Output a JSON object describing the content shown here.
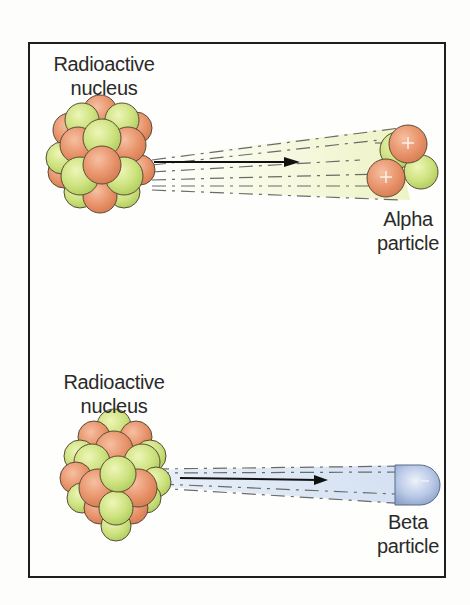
{
  "diagram": {
    "panels": [
      {
        "id": "alpha-decay",
        "source_label_line1": "Radioactive",
        "source_label_line2": "nucleus",
        "particle_label_line1": "Alpha",
        "particle_label_line2": "particle",
        "particle_composition": "2 protons (+) and 2 neutrons",
        "trail_color": "#f3f6dc",
        "proton_color": "#e8936a",
        "neutron_color": "#c9e07a"
      },
      {
        "id": "beta-decay",
        "source_label_line1": "Radioactive",
        "source_label_line2": "nucleus",
        "particle_label_line1": "Beta",
        "particle_label_line2": "particle",
        "particle_composition": "electron (−)",
        "trail_color": "#dde8f4",
        "particle_color": "#b7c8e6"
      }
    ],
    "colors": {
      "frame": "#1e1e1e",
      "text": "#2a2a2a",
      "proton": "#e8936a",
      "neutron": "#c9e07a",
      "outline": "#5a4a3a"
    },
    "symbols": {
      "proton_sign": "+",
      "electron_sign": "−"
    }
  }
}
